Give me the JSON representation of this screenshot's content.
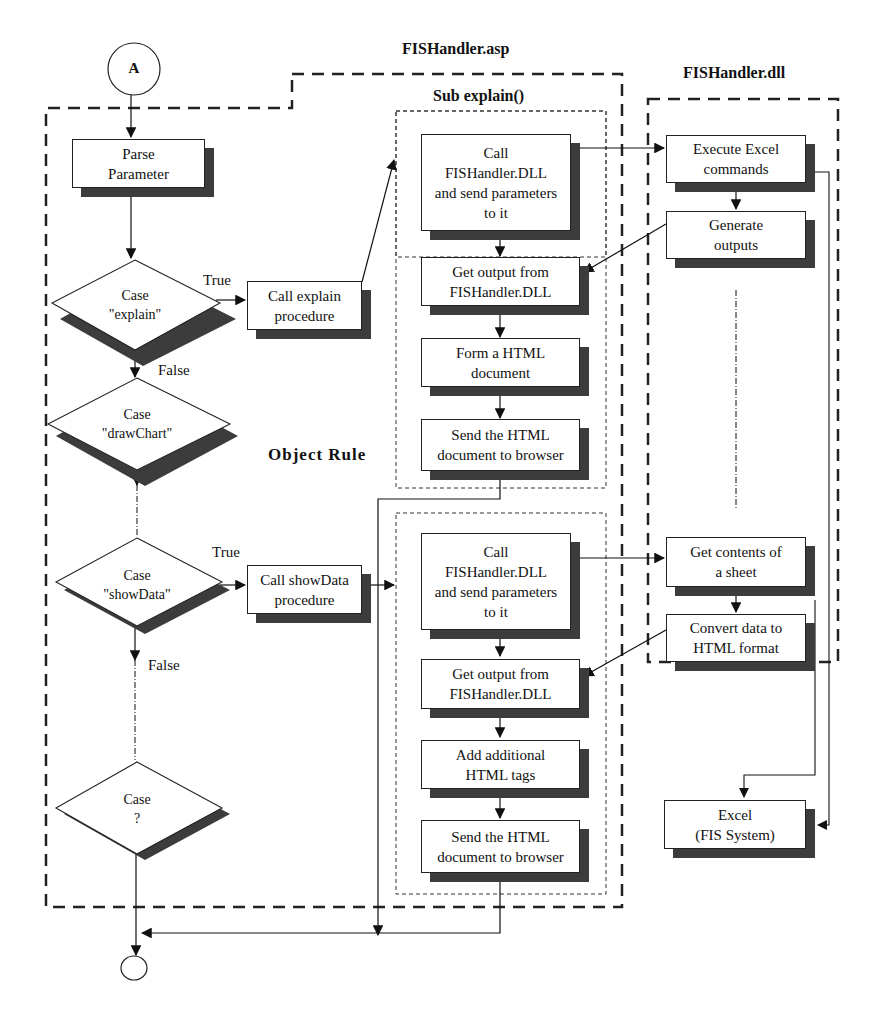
{
  "titles": {
    "asp": "FISHandler.asp",
    "dll": "FISHandler.dll",
    "sub_explain": "Sub explain()",
    "object_rule": "Object Rule"
  },
  "start_connector": "A",
  "decisions": {
    "explain": "Case\n\"explain\"",
    "drawchart": "Case\n\"drawChart\"",
    "showdata": "Case\n\"showData\"",
    "unknown": "Case\n?"
  },
  "edge_labels": {
    "explain_true": "True",
    "explain_false": "False",
    "showdata_true": "True",
    "showdata_false": "False"
  },
  "boxes": {
    "parse": "Parse\nParameter",
    "call_explain": "Call explain\nprocedure",
    "call_showdata": "Call showData\nprocedure",
    "explain_call_dll": "Call\nFISHandler.DLL\nand send parameters\nto it",
    "explain_get_output": "Get output from\nFISHandler.DLL",
    "explain_form_html": "Form a HTML\ndocument",
    "explain_send": "Send the HTML\ndocument to browser",
    "show_call_dll": "Call\nFISHandler.DLL\nand send parameters\nto it",
    "show_get_output": "Get output from\nFISHandler.DLL",
    "show_add_tags": "Add additional\nHTML tags",
    "show_send": "Send the HTML\ndocument to browser",
    "dll_execute": "Execute Excel\ncommands",
    "dll_generate": "Generate\noutputs",
    "dll_get_contents": "Get contents of\na sheet",
    "dll_convert": "Convert data to\nHTML format",
    "excel": "Excel\n(FIS System)"
  }
}
